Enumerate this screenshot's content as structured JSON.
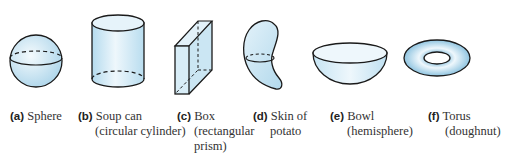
{
  "figure": {
    "colors": {
      "outline": "#1a1a1a",
      "fill_light": "#eaf5fb",
      "fill_mid": "#cbe6f3",
      "fill_dark": "#9fcde6"
    },
    "items": [
      {
        "letter": "(a)",
        "name": "Sphere",
        "detail": []
      },
      {
        "letter": "(b)",
        "name": "Soup can",
        "detail": [
          "(circular cylinder)"
        ]
      },
      {
        "letter": "(c)",
        "name": "Box",
        "detail": [
          "(rectangular",
          "prism)"
        ]
      },
      {
        "letter": "(d)",
        "name": "Skin of",
        "detail": [
          "potato"
        ]
      },
      {
        "letter": "(e)",
        "name": "Bowl",
        "detail": [
          "(hemisphere)"
        ]
      },
      {
        "letter": "(f)",
        "name": "Torus",
        "detail": [
          "(doughnut)"
        ]
      }
    ]
  }
}
